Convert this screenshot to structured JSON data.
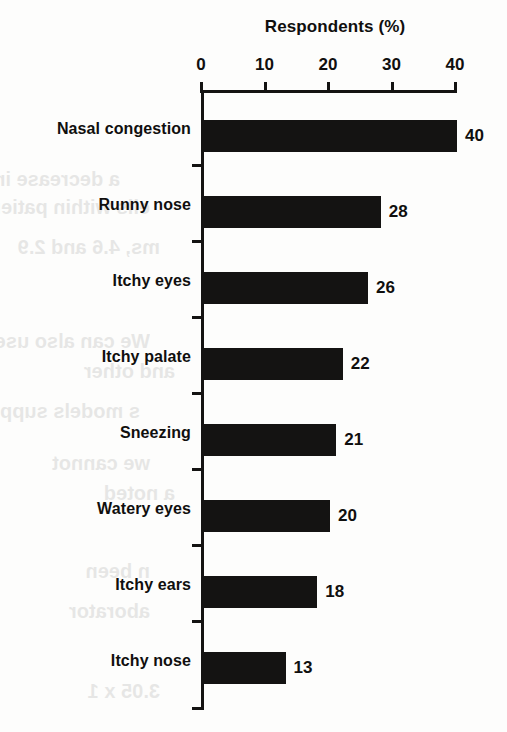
{
  "figure": {
    "title": "Respondents (%)",
    "background_color": "#fdfdfc",
    "ink_color": "#141312"
  },
  "axis": {
    "x_ticks": [
      "0",
      "10",
      "20",
      "30",
      "40"
    ]
  },
  "bleed_through_text": [
    "a decrease in serum",
    "ells within patients",
    "ms, 4.6 and 2.9",
    "We can also use",
    "and other",
    "s models supp",
    "we cannot",
    "a noted",
    "n been",
    "aborator",
    "3.05 x 1"
  ],
  "chart_data": {
    "type": "bar",
    "orientation": "horizontal",
    "title": "Respondents (%)",
    "xlabel": "Respondents (%)",
    "ylabel": "",
    "xlim": [
      0,
      40
    ],
    "xticks": [
      0,
      10,
      20,
      30,
      40
    ],
    "grid": false,
    "legend": false,
    "bar_color": "#141312",
    "show_value_labels": true,
    "categories": [
      "Nasal congestion",
      "Runny nose",
      "Itchy eyes",
      "Itchy palate",
      "Sneezing",
      "Watery eyes",
      "Itchy ears",
      "Itchy nose"
    ],
    "values": [
      40,
      28,
      26,
      22,
      21,
      20,
      18,
      13
    ],
    "value_labels": [
      "40",
      "28",
      "26",
      "22",
      "21",
      "20",
      "18",
      "13"
    ]
  }
}
